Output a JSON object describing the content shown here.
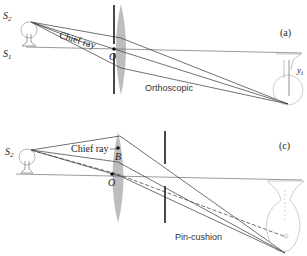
{
  "panels": [
    {
      "id": "a",
      "tag": "(a)",
      "caption": "Orthoscopic",
      "labels": {
        "source_top": "S",
        "source_top_sub": "2",
        "source_bottom": "S",
        "source_bottom_sub": "1",
        "chief_ray": "Chief ray",
        "lens_center": "O",
        "image_height": "y",
        "image_height_sub": "i"
      }
    },
    {
      "id": "c",
      "tag": "(c)",
      "caption": "Pin-cushion",
      "labels": {
        "source_top": "S",
        "source_top_sub": "2",
        "chief_ray": "Chief ray",
        "stop_point": "B",
        "lens_center": "O"
      }
    }
  ],
  "colors": {
    "lens": "#b8b8b8",
    "ray": "#333333",
    "stop": "#1a1a1a",
    "object_outline": "#888888"
  }
}
